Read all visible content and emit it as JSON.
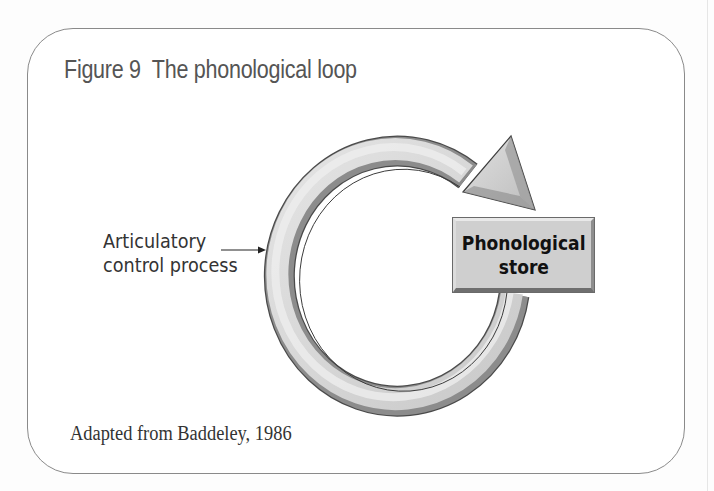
{
  "figure": {
    "title": "Figure 9  The phonological loop",
    "caption": "Adapted from Baddeley, 1986"
  },
  "diagram": {
    "label": {
      "line1": "Articulatory",
      "line2": "control process"
    },
    "store": {
      "line1": "Phonological",
      "line2": "store"
    },
    "icons": {
      "loop": "circular-arrow-icon",
      "pointer": "right-arrow-icon"
    },
    "colors": {
      "frame_border": "#8a8a8a",
      "title_text": "#555555",
      "ring_fill": "#d6d6d6",
      "ring_shadow": "#8c8c8c",
      "ring_outline": "#4a4a4a",
      "store_fill": "#cfcfcf",
      "label_text": "#333333"
    }
  }
}
